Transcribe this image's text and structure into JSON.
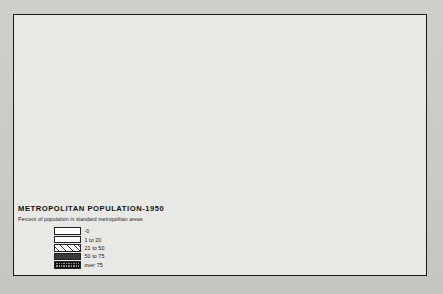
{
  "map": {
    "title": "METROPOLITAN POPULATION-1950",
    "subtitle": "Percent of population in standard metropolitan areas",
    "legend_items": [
      {
        "label": "-0",
        "class": "f0",
        "swatch": "white-blank"
      },
      {
        "label": "1 to 20",
        "class": "f1",
        "swatch": "fine-dot-stipple"
      },
      {
        "label": "21 to 50",
        "class": "f2",
        "swatch": "diagonal-hatch"
      },
      {
        "label": "50 to 75",
        "class": "f3",
        "swatch": "dense-gray-stipple"
      },
      {
        "label": "over 75",
        "class": "f4",
        "swatch": "dark-crosshatch"
      }
    ],
    "states": [
      {
        "code": "WA",
        "name": "Washington",
        "class": "f3"
      },
      {
        "code": "OR",
        "name": "Oregon",
        "class": "f2"
      },
      {
        "code": "CA",
        "name": "California",
        "class": "f4"
      },
      {
        "code": "NV",
        "name": "Nevada",
        "class": "f0"
      },
      {
        "code": "ID",
        "name": "Idaho",
        "class": "f0"
      },
      {
        "code": "MT",
        "name": "Montana",
        "class": "f0"
      },
      {
        "code": "WY",
        "name": "Wyoming",
        "class": "f0"
      },
      {
        "code": "UT",
        "name": "Utah",
        "class": "f3"
      },
      {
        "code": "AZ",
        "name": "Arizona",
        "class": "f2"
      },
      {
        "code": "CO",
        "name": "Colorado",
        "class": "f2"
      },
      {
        "code": "NM",
        "name": "New Mexico",
        "class": "f2"
      },
      {
        "code": "ND",
        "name": "North Dakota",
        "class": "f0"
      },
      {
        "code": "SD",
        "name": "South Dakota",
        "class": "f1"
      },
      {
        "code": "NE",
        "name": "Nebraska",
        "class": "f2"
      },
      {
        "code": "KS",
        "name": "Kansas",
        "class": "f2"
      },
      {
        "code": "OK",
        "name": "Oklahoma",
        "class": "f2"
      },
      {
        "code": "TX",
        "name": "Texas",
        "class": "f2"
      },
      {
        "code": "MN",
        "name": "Minnesota",
        "class": "f2"
      },
      {
        "code": "IA",
        "name": "Iowa",
        "class": "f2"
      },
      {
        "code": "MO",
        "name": "Missouri",
        "class": "f3"
      },
      {
        "code": "AR",
        "name": "Arkansas",
        "class": "f1"
      },
      {
        "code": "LA",
        "name": "Louisiana",
        "class": "f2"
      },
      {
        "code": "WI",
        "name": "Wisconsin",
        "class": "f2"
      },
      {
        "code": "IL",
        "name": "Illinois",
        "class": "f3"
      },
      {
        "code": "MI",
        "name": "Michigan",
        "class": "f3"
      },
      {
        "code": "IN",
        "name": "Indiana",
        "class": "f3"
      },
      {
        "code": "OH",
        "name": "Ohio",
        "class": "f3"
      },
      {
        "code": "KY",
        "name": "Kentucky",
        "class": "f2"
      },
      {
        "code": "TN",
        "name": "Tennessee",
        "class": "f2"
      },
      {
        "code": "MS",
        "name": "Mississippi",
        "class": "f1"
      },
      {
        "code": "AL",
        "name": "Alabama",
        "class": "f2"
      },
      {
        "code": "GA",
        "name": "Georgia",
        "class": "f2"
      },
      {
        "code": "FL",
        "name": "Florida",
        "class": "f2"
      },
      {
        "code": "SC",
        "name": "South Carolina",
        "class": "f2"
      },
      {
        "code": "NC",
        "name": "North Carolina",
        "class": "f2"
      },
      {
        "code": "VA",
        "name": "Virginia",
        "class": "f2"
      },
      {
        "code": "WV",
        "name": "West Virginia",
        "class": "f2"
      },
      {
        "code": "MD",
        "name": "Maryland",
        "class": "f3"
      },
      {
        "code": "DE",
        "name": "Delaware",
        "class": "f4"
      },
      {
        "code": "PA",
        "name": "Pennsylvania",
        "class": "f4"
      },
      {
        "code": "NJ",
        "name": "New Jersey",
        "class": "f4"
      },
      {
        "code": "NY",
        "name": "New York",
        "class": "f4"
      },
      {
        "code": "CT",
        "name": "Connecticut",
        "class": "f4"
      },
      {
        "code": "RI",
        "name": "Rhode Island",
        "class": "f4"
      },
      {
        "code": "MA",
        "name": "Massachusetts",
        "class": "f4"
      },
      {
        "code": "VT",
        "name": "Vermont",
        "class": "f1"
      },
      {
        "code": "NH",
        "name": "New Hampshire",
        "class": "f1"
      },
      {
        "code": "ME",
        "name": "Maine",
        "class": "f1"
      }
    ]
  }
}
